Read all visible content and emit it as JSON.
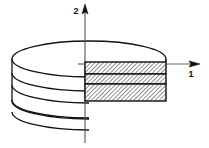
{
  "figure": {
    "name": "layered-disk-cross-section",
    "background_color": "#ffffff",
    "stroke_color": "#111111",
    "hatch_color": "#333333",
    "axes": {
      "horizontal": {
        "label": "1",
        "label_x": 191,
        "label_y": 76,
        "line_y": 64,
        "line_x_start": 78,
        "line_x_end": 196,
        "arrow_tip_x": 199,
        "arrow_direction": "right"
      },
      "vertical": {
        "label": "2",
        "label_x": 77,
        "label_y": 13,
        "line_x": 85,
        "line_y_start": 9,
        "line_y_end": 143,
        "arrow_tip_y": 5,
        "arrow_direction": "up"
      }
    },
    "disk": {
      "center_x": 89,
      "top_ellipse_center_y": 59,
      "radius_x": 77,
      "radius_y": 18,
      "left_edge_x": 12,
      "right_edge_x": 166,
      "layer_offsets": [
        0,
        14,
        26,
        41,
        55,
        70
      ],
      "layer_count": 3
    },
    "cross_section": {
      "x": 85,
      "width": 81,
      "bands": [
        {
          "name": "top-layer",
          "y": 62,
          "height": 12
        },
        {
          "name": "middle-layer",
          "y": 75,
          "height": 9
        },
        {
          "name": "bottom-layer",
          "y": 86,
          "height": 15
        }
      ],
      "hatch_pattern": "diagonal-45",
      "hatch_spacing": 3
    }
  }
}
